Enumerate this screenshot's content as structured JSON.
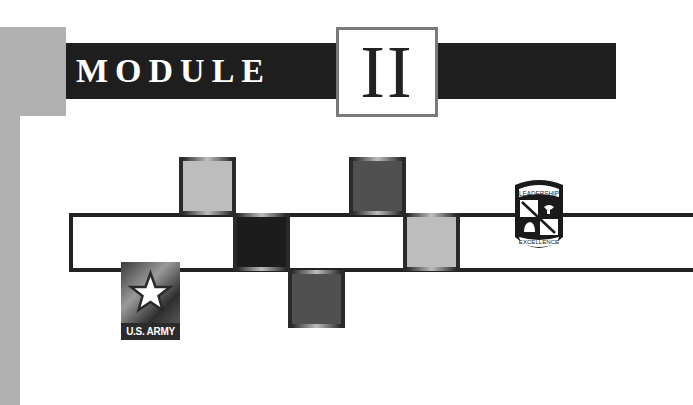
{
  "header": {
    "label": "MODULE",
    "numeral": "II"
  },
  "logos": {
    "army": {
      "label": "U.S. ARMY",
      "icon": "star-icon"
    },
    "rotc": {
      "top_text": "LEADERSHIP",
      "bottom_text": "EXCELLENCE",
      "icon": "shield-icon"
    }
  },
  "colors": {
    "banner": "#1e1e1e",
    "side_gray": "#b0b0b0",
    "numeral_border": "#7a7a7a",
    "square_light": "#bdbdbd",
    "square_dark": "#505050",
    "square_black": "#1c1c1c"
  }
}
